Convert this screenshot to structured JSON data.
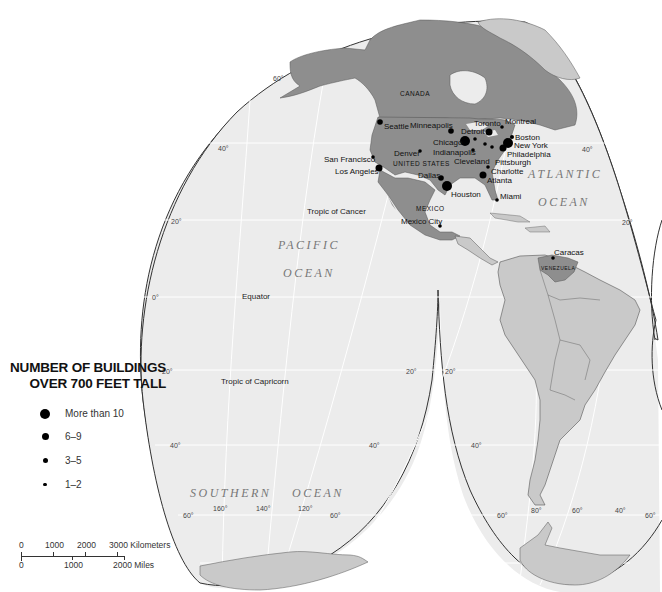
{
  "legend": {
    "title_line1": "NUMBER OF BUILDINGS",
    "title_line2": "OVER 700 FEET TALL",
    "items": [
      {
        "label": "More than 10",
        "size": 10
      },
      {
        "label": "6–9",
        "size": 7
      },
      {
        "label": "3–5",
        "size": 5
      },
      {
        "label": "1–2",
        "size": 3.5
      }
    ]
  },
  "scale": {
    "km_labels": [
      "0",
      "1000",
      "2000",
      "3000 Kilometers"
    ],
    "mile_labels": [
      "0",
      "1000",
      "2000 Miles"
    ]
  },
  "oceans": {
    "pacific_1": "PACIFIC",
    "pacific_2": "OCEAN",
    "atlantic_1": "ATLANTIC",
    "atlantic_2": "OCEAN",
    "southern_1": "SOUTHERN",
    "southern_2": "OCEAN"
  },
  "countries": {
    "canada": "CANADA",
    "usa": "UNITED STATES",
    "mexico": "MEXICO",
    "venezuela": "VENEZUELA"
  },
  "lines": {
    "tropic_cancer": "Tropic of Cancer",
    "equator": "Equator",
    "tropic_capricorn": "Tropic of Capricorn"
  },
  "cities": [
    {
      "name": "Seattle",
      "category": "3–5"
    },
    {
      "name": "Minneapolis",
      "category": "3–5"
    },
    {
      "name": "Detroit",
      "category": "3–5"
    },
    {
      "name": "Toronto",
      "category": "6–9"
    },
    {
      "name": "Montreal",
      "category": "1–2"
    },
    {
      "name": "Boston",
      "category": "3–5"
    },
    {
      "name": "New York",
      "category": "More than 10"
    },
    {
      "name": "Philadelphia",
      "category": "6–9"
    },
    {
      "name": "Pittsburgh",
      "category": "1–2"
    },
    {
      "name": "Cleveland",
      "category": "1–2"
    },
    {
      "name": "Chicago",
      "category": "More than 10"
    },
    {
      "name": "Indianapolis",
      "category": "1–2"
    },
    {
      "name": "Denver",
      "category": "3–5"
    },
    {
      "name": "San Francisco",
      "category": "1–2"
    },
    {
      "name": "Los Angeles",
      "category": "6–9"
    },
    {
      "name": "Dallas",
      "category": "3–5"
    },
    {
      "name": "Houston",
      "category": "More than 10"
    },
    {
      "name": "Charlotte",
      "category": "1–2"
    },
    {
      "name": "Atlanta",
      "category": "6–9"
    },
    {
      "name": "Miami",
      "category": "1–2"
    },
    {
      "name": "Mexico City",
      "category": "1–2"
    },
    {
      "name": "Caracas",
      "category": "1–2"
    }
  ],
  "degree_labels": {
    "lat_60": "60°",
    "lat_40": "40°",
    "lat_20": "20°",
    "lat_0": "0°",
    "lon_160": "160°",
    "lon_140": "140°",
    "lon_120": "120°",
    "lon_80": "80°",
    "lon_60": "60°",
    "lon_40": "40°"
  },
  "colors": {
    "ocean": "#ececec",
    "land_highlight": "#8e8e8e",
    "land_other": "#c9c9c9",
    "graticule": "#ffffff",
    "outline": "#333333"
  }
}
